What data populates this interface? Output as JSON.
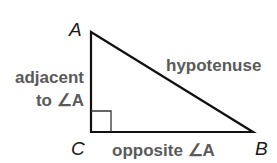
{
  "diagram": {
    "vertices": {
      "A": {
        "label": "A",
        "x": 91,
        "y": 32
      },
      "B": {
        "label": "B",
        "x": 253,
        "y": 132
      },
      "C": {
        "label": "C",
        "x": 91,
        "y": 132
      }
    },
    "labels": {
      "hypotenuse": "hypotenuse",
      "adjacent_line1": "adjacent",
      "adjacent_line2": "to ∠A",
      "opposite": "opposite ∠A"
    },
    "colors": {
      "stroke": "#111111",
      "label_text": "#5a5a5a",
      "vertex_text": "#1a1a1a"
    },
    "right_angle_marker": {
      "at": "C",
      "size": 20
    }
  }
}
